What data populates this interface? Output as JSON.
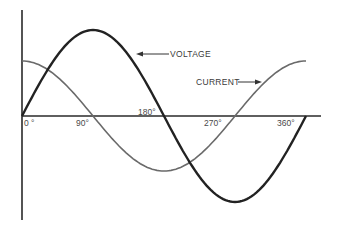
{
  "chart_data": {
    "type": "line",
    "title": "",
    "xlabel": "",
    "ylabel": "",
    "x_unit": "degrees",
    "tick_labels": [
      "0 °",
      "90°",
      "180°",
      "270°",
      "360°"
    ],
    "tick_values": [
      0,
      90,
      180,
      270,
      360
    ],
    "xlim": [
      0,
      360
    ],
    "ylim": [
      -1,
      1
    ],
    "grid": false,
    "legend": "annotations with arrows",
    "series": [
      {
        "name": "VOLTAGE",
        "function": "sin(x)",
        "amplitude": 1.0,
        "phase_deg": 0,
        "color": "#222222",
        "x": [
          0,
          45,
          90,
          135,
          180,
          225,
          270,
          315,
          360
        ],
        "values": [
          0,
          0.71,
          1.0,
          0.71,
          0,
          -0.71,
          -1.0,
          -0.71,
          0
        ]
      },
      {
        "name": "CURRENT",
        "function": "cos(x)",
        "amplitude": 0.64,
        "phase_deg": 90,
        "color": "#6a6a6a",
        "x": [
          0,
          45,
          90,
          135,
          180,
          225,
          270,
          315,
          360
        ],
        "values": [
          0.64,
          0.45,
          0,
          -0.45,
          -0.64,
          -0.45,
          0,
          0.45,
          0.64
        ]
      }
    ],
    "annotations": [
      {
        "text": "VOLTAGE",
        "points_to": "voltage curve near 150°"
      },
      {
        "text": "CURRENT",
        "points_to": "current curve near 320°"
      }
    ]
  },
  "labels": {
    "voltage": "VOLTAGE",
    "current": "CURRENT",
    "t0": "0 °",
    "t90": "90°",
    "t180": "180°",
    "t270": "270°",
    "t360": "360°"
  }
}
